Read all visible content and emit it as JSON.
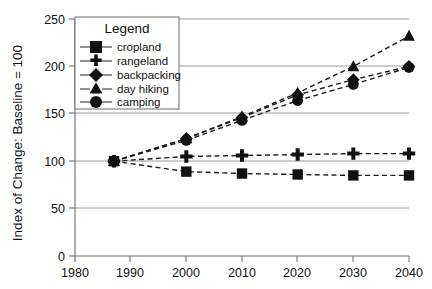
{
  "chart_data": {
    "type": "line",
    "title": "",
    "xlabel": "",
    "ylabel": "Index of Change: Baseline = 100",
    "x": [
      1987,
      2000,
      2010,
      2020,
      2030,
      2040
    ],
    "xlim": [
      1980,
      2040
    ],
    "ylim": [
      0,
      250
    ],
    "xticks": [
      1980,
      1990,
      2000,
      2010,
      2020,
      2030,
      2040
    ],
    "yticks": [
      0,
      50,
      100,
      150,
      200,
      250
    ],
    "grid": true,
    "legend_position": "upper-left-inside",
    "legend_title": "Legend",
    "series": [
      {
        "name": "cropland",
        "marker": "square",
        "values": [
          100,
          89,
          87,
          86,
          85,
          85
        ]
      },
      {
        "name": "rangeland",
        "marker": "plus",
        "values": [
          100,
          105,
          106,
          107,
          108,
          108
        ]
      },
      {
        "name": "backpacking",
        "marker": "diamond",
        "values": [
          100,
          124,
          146,
          170,
          186,
          200
        ]
      },
      {
        "name": "day hiking",
        "marker": "triangle",
        "values": [
          100,
          124,
          147,
          172,
          200,
          232
        ]
      },
      {
        "name": "camping",
        "marker": "circle",
        "values": [
          100,
          122,
          143,
          164,
          181,
          199
        ]
      }
    ]
  },
  "axes": {
    "xtick_labels": [
      "1980",
      "1990",
      "2000",
      "2010",
      "2020",
      "2030",
      "2040"
    ],
    "ytick_labels": [
      "0",
      "50",
      "100",
      "150",
      "200",
      "250"
    ],
    "ylabel": "Index of Change: Baseline = 100"
  },
  "legend": {
    "title": "Legend",
    "items": [
      {
        "label": "cropland",
        "marker": "square-marker-icon"
      },
      {
        "label": "rangeland",
        "marker": "plus-marker-icon"
      },
      {
        "label": "backpacking",
        "marker": "diamond-marker-icon"
      },
      {
        "label": "day hiking",
        "marker": "triangle-marker-icon"
      },
      {
        "label": "camping",
        "marker": "circle-marker-icon"
      }
    ]
  },
  "colors": {
    "series": "#111111",
    "grid": "#9a9a9a",
    "axis": "#6d6d6d",
    "background": "#ffffff"
  }
}
